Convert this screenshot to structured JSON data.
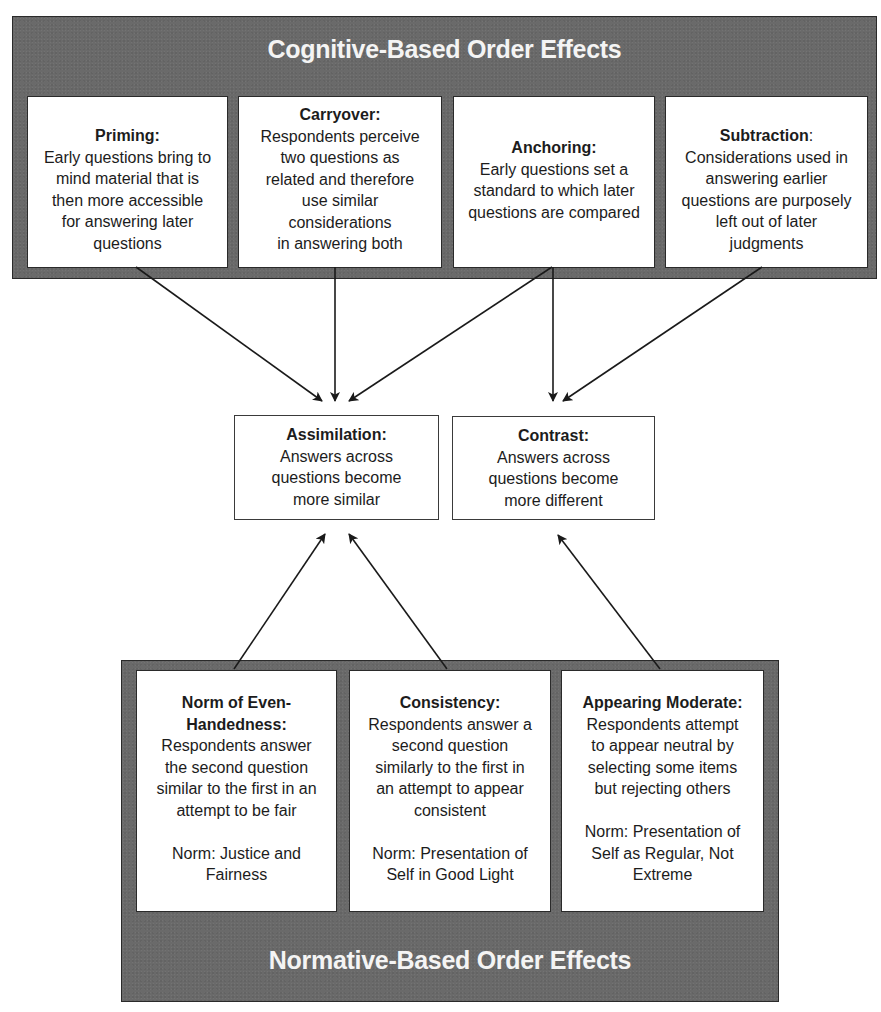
{
  "cognitive_panel": {
    "title": "Cognitive-Based Order Effects",
    "boxes": [
      {
        "heading": "Priming:",
        "lines": [
          "Early questions bring to",
          "mind material that is",
          "then more accessible",
          "for answering later",
          "questions"
        ]
      },
      {
        "heading": "Carryover:",
        "lines": [
          "Respondents perceive",
          "two questions as",
          "related and therefore",
          "use similar",
          "considerations",
          "in answering both"
        ]
      },
      {
        "heading": "Anchoring:",
        "lines": [
          "Early questions set a",
          "standard to which later",
          "questions are compared"
        ]
      },
      {
        "heading": "Subtraction",
        "heading_suffix": ":",
        "lines": [
          "Considerations used in",
          "answering earlier",
          "questions are purposely",
          "left out of later",
          "judgments"
        ]
      }
    ]
  },
  "outcomes": [
    {
      "heading": "Assimilation:",
      "lines": [
        "Answers across",
        "questions become",
        "more similar"
      ]
    },
    {
      "heading": "Contrast:",
      "lines": [
        "Answers across",
        "questions become",
        "more different"
      ]
    }
  ],
  "normative_panel": {
    "title": "Normative-Based Order Effects",
    "boxes": [
      {
        "heading_lines": [
          "Norm of Even-",
          "Handedness:"
        ],
        "lines": [
          "Respondents answer",
          "the second question",
          "similar to the first in an",
          "attempt to be fair"
        ],
        "norm_lines": [
          "Norm: Justice and",
          "Fairness"
        ]
      },
      {
        "heading_lines": [
          "Consistency:"
        ],
        "lines": [
          "Respondents answer a",
          "second question",
          "similarly to the first in",
          "an attempt to appear",
          "consistent"
        ],
        "norm_lines": [
          "Norm: Presentation of",
          "Self in Good Light"
        ]
      },
      {
        "heading_lines": [
          "Appearing Moderate:"
        ],
        "lines": [
          "Respondents attempt",
          "to appear neutral by",
          "selecting some items",
          "but rejecting others"
        ],
        "norm_lines": [
          "Norm: Presentation of",
          "Self as Regular, Not",
          "Extreme"
        ]
      }
    ]
  },
  "connections": [
    {
      "from": "Priming",
      "to": "Assimilation"
    },
    {
      "from": "Carryover",
      "to": "Assimilation"
    },
    {
      "from": "Anchoring",
      "to": "Assimilation"
    },
    {
      "from": "Anchoring",
      "to": "Contrast"
    },
    {
      "from": "Subtraction",
      "to": "Contrast"
    },
    {
      "from": "Norm of Even-Handedness",
      "to": "Assimilation"
    },
    {
      "from": "Consistency",
      "to": "Assimilation"
    },
    {
      "from": "Appearing Moderate",
      "to": "Contrast"
    }
  ],
  "colors": {
    "panel": "#6a6a6a",
    "panel_title": "#f4f4f4",
    "box_bg": "#ffffff",
    "line": "#1a1a1a"
  }
}
